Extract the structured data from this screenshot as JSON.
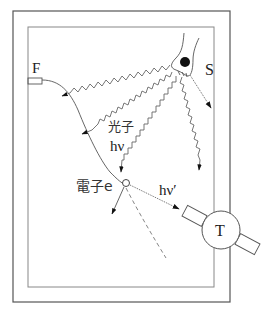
{
  "diagram": {
    "type": "Compton scattering experimental setup",
    "labels": {
      "filament": "F",
      "source": "S",
      "photon": "光子",
      "photon_energy": "hν",
      "electron": "電子e",
      "scattered_photon": "hν′",
      "detector": "T"
    },
    "colors": {
      "line": "#555555",
      "frame_outer": "#555555",
      "frame_inner": "#888888",
      "arrow": "#111111",
      "background": "#ffffff"
    }
  }
}
